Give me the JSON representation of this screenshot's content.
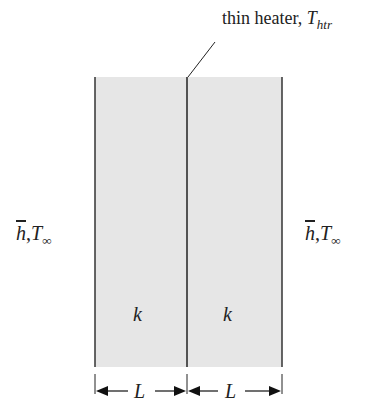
{
  "diagram": {
    "heater_label": "thin heater, ",
    "heater_symbol": "T",
    "heater_subscript": "htr",
    "left_fluid": {
      "h": "h",
      "sep": ",",
      "T": "T",
      "sub": "∞"
    },
    "right_fluid": {
      "h": "h",
      "sep": ",",
      "T": "T",
      "sub": "∞"
    },
    "left_conductivity": "k",
    "right_conductivity": "k",
    "left_length": "L",
    "right_length": "L",
    "colors": {
      "slab_fill": "#e6e6e6",
      "line": "#222222"
    }
  }
}
